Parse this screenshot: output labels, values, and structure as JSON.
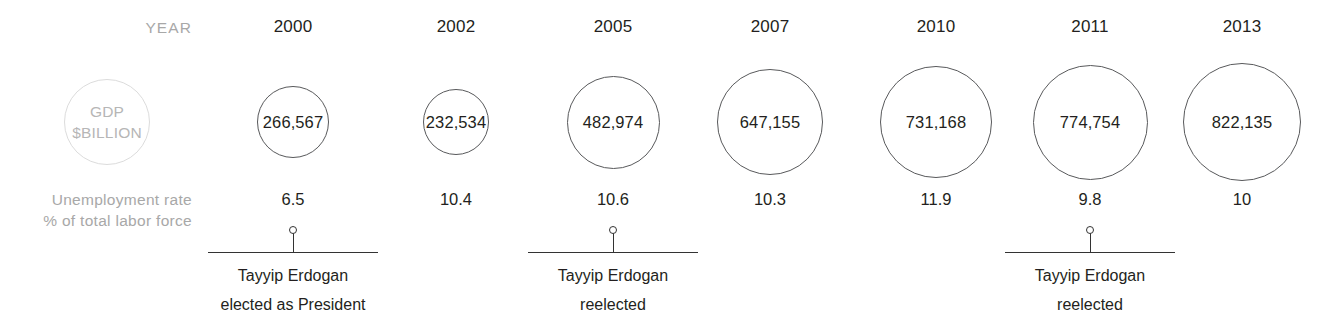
{
  "labels": {
    "year": "YEAR",
    "gdp_legend_line1": "GDP",
    "gdp_legend_line2": "$BILLION",
    "unemployment_line1": "Unemployment rate",
    "unemployment_line2": "% of total labor force"
  },
  "colors": {
    "muted_text": "#a8a8a8",
    "legend_circle_stroke": "#dcdcdc",
    "bubble_stroke": "#58595b",
    "text": "#231f20",
    "annotation_line": "#333333",
    "background": "#ffffff"
  },
  "chart_data": {
    "type": "bar",
    "title": "",
    "subtitle": "",
    "xlabel": "YEAR",
    "ylabel": "GDP $BILLION",
    "grid": false,
    "legend_position": "left",
    "categories": [
      "2000",
      "2002",
      "2005",
      "2007",
      "2010",
      "2011",
      "2013"
    ],
    "series": [
      {
        "name": "GDP $BILLION",
        "display": "bubble",
        "values": [
          266567,
          232534,
          482974,
          647155,
          731168,
          774754,
          822135
        ],
        "labels": [
          "266,567",
          "232,534",
          "482,974",
          "647,155",
          "731,168",
          "774,754",
          "822,135"
        ],
        "bubble_diameters_px": [
          72,
          66,
          93,
          106,
          112,
          115,
          118
        ]
      },
      {
        "name": "Unemployment rate % of total labor force",
        "display": "text",
        "values": [
          6.5,
          10.4,
          10.6,
          10.3,
          11.9,
          9.8,
          10
        ],
        "labels": [
          "6.5",
          "10.4",
          "10.6",
          "10.3",
          "11.9",
          "9.8",
          "10"
        ]
      }
    ],
    "column_centers_px": [
      293,
      456,
      613,
      770,
      936,
      1090,
      1242
    ],
    "annotations": [
      {
        "category": "2000",
        "line1": "Tayyip Erdogan",
        "line2": "elected as President",
        "center_px": 293
      },
      {
        "category": "2005",
        "line1": "Tayyip Erdogan",
        "line2": "reelected",
        "center_px": 613
      },
      {
        "category": "2011",
        "line1": "Tayyip Erdogan",
        "line2": "reelected",
        "center_px": 1090
      }
    ]
  }
}
